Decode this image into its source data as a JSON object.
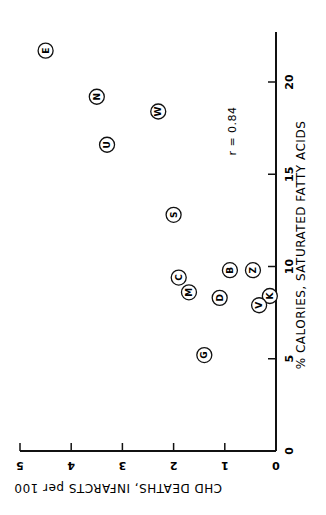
{
  "chart_data": {
    "type": "scatter",
    "orientation": "rotated 90 degrees clockwise (page printed sideways)",
    "title": "",
    "xlabel": "% CALORIES, SATURATED FATTY ACIDS",
    "ylabel": "CHD DEATHS, INFARCTS per 100",
    "xlim": [
      0,
      23
    ],
    "ylim": [
      0,
      5
    ],
    "xticks": [
      0,
      5,
      10,
      15,
      20
    ],
    "yticks": [
      0,
      1,
      2,
      3,
      4,
      5
    ],
    "grid": false,
    "legend": null,
    "annotations": [
      {
        "text": "r = 0.84"
      }
    ],
    "points": [
      {
        "label": "E",
        "x": 21.7,
        "y": 4.5
      },
      {
        "label": "N",
        "x": 19.2,
        "y": 3.5
      },
      {
        "label": "W",
        "x": 18.4,
        "y": 2.3
      },
      {
        "label": "U",
        "x": 16.6,
        "y": 3.3
      },
      {
        "label": "S",
        "x": 12.8,
        "y": 2.0
      },
      {
        "label": "C",
        "x": 9.4,
        "y": 1.9
      },
      {
        "label": "M",
        "x": 8.6,
        "y": 1.7
      },
      {
        "label": "B",
        "x": 9.8,
        "y": 0.9
      },
      {
        "label": "Z",
        "x": 9.8,
        "y": 0.45
      },
      {
        "label": "D",
        "x": 8.3,
        "y": 1.1
      },
      {
        "label": "K",
        "x": 8.4,
        "y": 0.12
      },
      {
        "label": "V",
        "x": 7.9,
        "y": 0.33
      },
      {
        "label": "G",
        "x": 5.2,
        "y": 1.4
      }
    ]
  },
  "labels": {
    "x_axis": "% CALORIES, SATURATED FATTY ACIDS",
    "y_axis": "CHD DEATHS, INFARCTS per 100",
    "correlation": "r = 0.84"
  }
}
